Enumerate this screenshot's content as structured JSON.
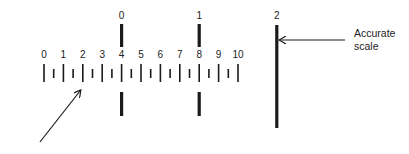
{
  "diagram": {
    "title": "",
    "colors": {
      "ink": "#1a1a1a",
      "background": "#ffffff"
    },
    "lower_scale": {
      "labels": [
        "0",
        "1",
        "2",
        "3",
        "4",
        "5",
        "6",
        "7",
        "8",
        "9",
        "10"
      ],
      "min": 0,
      "max": 10,
      "minor_ticks_between_majors": 1
    },
    "upper_scale": {
      "labels": [
        {
          "text": "0",
          "aligned_to_lower_value": 4
        },
        {
          "text": "1",
          "aligned_to_lower_value": 8
        },
        {
          "text": "2",
          "aligned_to_lower_value": 12
        }
      ]
    },
    "annotations": {
      "accurate_scale_line1": "Accurate",
      "accurate_scale_line2": "scale",
      "lower_arrow_target_value": 2
    }
  }
}
